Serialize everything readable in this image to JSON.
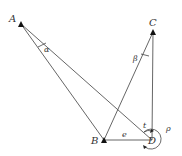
{
  "diagram": {
    "type": "geometry",
    "points": [
      {
        "id": "A",
        "label": "A",
        "x": 21,
        "y": 24
      },
      {
        "id": "C",
        "label": "C",
        "x": 153,
        "y": 32
      },
      {
        "id": "B",
        "label": "B",
        "x": 104,
        "y": 140
      },
      {
        "id": "D",
        "label": "D",
        "x": 152,
        "y": 140
      }
    ],
    "segments": [
      [
        "A",
        "B"
      ],
      [
        "A",
        "D"
      ],
      [
        "C",
        "B"
      ],
      [
        "C",
        "D"
      ],
      [
        "B",
        "D"
      ]
    ],
    "angle_labels": {
      "alpha": "α",
      "beta": "β",
      "e": "e",
      "t": "t",
      "rho": "ρ"
    },
    "colors": {
      "line": "#555555",
      "marker": "#111111",
      "text": "#333333",
      "background": "#ffffff"
    }
  }
}
